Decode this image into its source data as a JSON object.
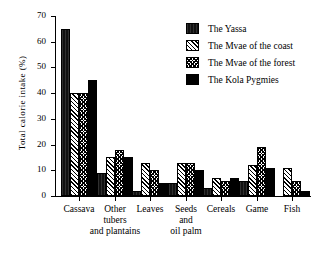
{
  "chart_data": {
    "type": "bar",
    "title": "",
    "xlabel": "",
    "ylabel": "Total calorie intake (%)",
    "ylim": [
      0,
      70
    ],
    "yticks": [
      0,
      10,
      20,
      30,
      40,
      50,
      60,
      70
    ],
    "grid": false,
    "legend_position": "top-right",
    "categories": [
      "Cassava",
      "Other\ntubers\nand plantains",
      "Leaves",
      "Seeds\nand\noil palm",
      "Cereals",
      "Game",
      "Fish"
    ],
    "series": [
      {
        "name": "The Yassa",
        "values": [
          65,
          9,
          2,
          5,
          3,
          6,
          0
        ]
      },
      {
        "name": "The Mvae of the coast",
        "values": [
          40,
          15,
          13,
          13,
          7,
          12,
          11
        ]
      },
      {
        "name": "The Mvae of the forest",
        "values": [
          40,
          18,
          10,
          13,
          6,
          19,
          6
        ]
      },
      {
        "name": "The Kola Pygmies",
        "values": [
          45,
          15,
          5,
          10,
          7,
          11,
          2
        ]
      }
    ]
  },
  "legend": {
    "items": [
      {
        "label": "The Yassa"
      },
      {
        "label": "The Mvae of the coast"
      },
      {
        "label": "The Mvae of the forest"
      },
      {
        "label": "The Kola Pygmies"
      }
    ]
  },
  "colors": {
    "axis": "#000000",
    "background": "#ffffff",
    "series_yassa": "#111111",
    "series_mvae_coast": "#ffffff",
    "series_mvae_forest": "#ffffff",
    "series_kola": "#000000"
  }
}
